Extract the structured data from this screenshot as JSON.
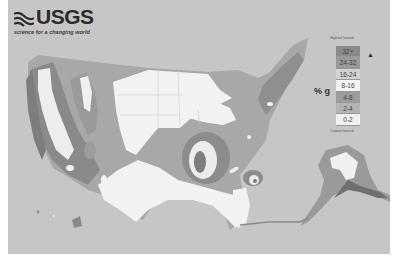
{
  "logo": {
    "name": "USGS",
    "tagline": "science for a changing world"
  },
  "legend": {
    "top_label": "Highest hazard",
    "bottom_label": "Lowest hazard",
    "unit": "% g",
    "arrow": "▲",
    "classes": [
      {
        "label": "32+",
        "color": "#8a8a8a"
      },
      {
        "label": "24-32",
        "color": "#999999"
      },
      {
        "label": "16-24",
        "color": "#d2d2d2"
      },
      {
        "label": "8-16",
        "color": "#f4f4f4"
      },
      {
        "label": "4-8",
        "color": "#9c9c9c"
      },
      {
        "label": "2-4",
        "color": "#b4b4b4"
      },
      {
        "label": "0-2",
        "color": "#f0f0f0"
      }
    ]
  },
  "colors": {
    "background": "#c6c6c6",
    "border": "#ffffff",
    "low_white": "#f2f2f2",
    "mid_gray": "#a9a9a9",
    "dark_gray": "#8c8c8c",
    "high_gray": "#7d7d7d"
  }
}
